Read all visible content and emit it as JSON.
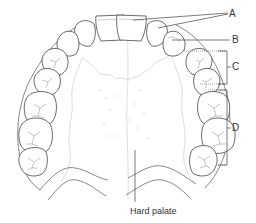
{
  "figure": {
    "type": "Dental arch diagram (maxillary, occlusal view)",
    "labels": {
      "A": "A",
      "B": "B",
      "C": "C",
      "D": "D",
      "hard_palate": "Hard palate"
    },
    "colors": {
      "line": "#444444",
      "background": "#ffffff"
    }
  }
}
